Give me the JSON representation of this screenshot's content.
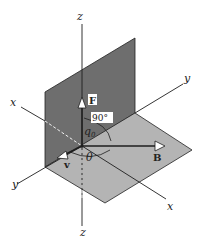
{
  "diagram": {
    "type": "3d-axes-magnetic-force",
    "axes": {
      "z_top": "z",
      "z_bottom": "z",
      "x_back": "x",
      "x_front": "x",
      "y_back": "y",
      "y_front": "y"
    },
    "vectors": {
      "force": "F",
      "velocity": "v",
      "field": "B"
    },
    "charge": "q",
    "charge_subscript": "0",
    "angles": {
      "right_angle": "90°",
      "theta": "θ"
    },
    "colors": {
      "vertical_plane": "#6e6e6e",
      "horizontal_plane": "#b4b4b4",
      "lines": "#1e1e1e",
      "background": "#ffffff"
    }
  }
}
